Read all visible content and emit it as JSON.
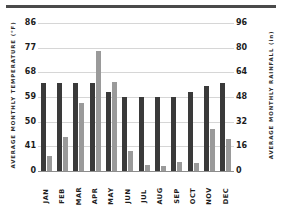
{
  "chart_data": {
    "type": "bar",
    "title": "",
    "xlabel": "",
    "ylabel": "AVERAGE MONTHLY TEMPERATURE (°F)",
    "y2label": "AVERAGE MONTHLY RAINFALL (in)",
    "grid": true,
    "legend": "none",
    "categories": [
      "JAN",
      "FEB",
      "MAR",
      "APR",
      "MAY",
      "JUN",
      "JUL",
      "AUG",
      "SEP",
      "OCT",
      "NOV",
      "DEC"
    ],
    "left_axis": {
      "label": "AVERAGE MONTHLY TEMPERATURE (°F)",
      "ticks": [
        0,
        41,
        50,
        59,
        68,
        77,
        86
      ],
      "ylim": [
        0,
        86
      ]
    },
    "right_axis": {
      "label": "AVERAGE MONTHLY RAINFALL (in)",
      "ticks": [
        0,
        16,
        32,
        48,
        64,
        80,
        96
      ],
      "ylim": [
        0,
        96
      ]
    },
    "series": [
      {
        "name": "Average Monthly Temperature",
        "axis": "left",
        "color": "#3a3a3a",
        "values": [
          64,
          64,
          64,
          64,
          61,
          59,
          59,
          59,
          59,
          61,
          63,
          64
        ]
      },
      {
        "name": "Average Monthly Rainfall",
        "axis": "right",
        "color": "#9a9a9a",
        "values": [
          10,
          22,
          44,
          78,
          58,
          13,
          4,
          3,
          6,
          5,
          27,
          21
        ]
      }
    ]
  },
  "ticks": {
    "left": [
      "86",
      "77",
      "68",
      "59",
      "50",
      "41",
      "0"
    ],
    "right": [
      "96",
      "80",
      "64",
      "48",
      "32",
      "16",
      "0"
    ]
  }
}
